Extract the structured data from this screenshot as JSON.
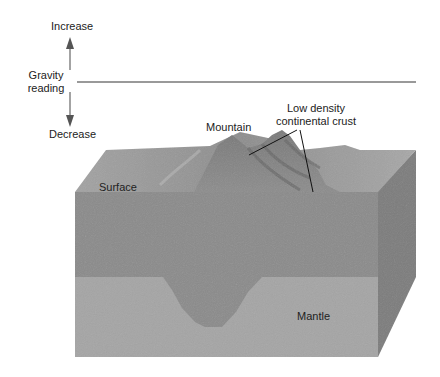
{
  "gravity_axis": {
    "increase_label": "Increase",
    "reading_label_line1": "Gravity",
    "reading_label_line2": "reading",
    "decrease_label": "Decrease"
  },
  "labels": {
    "mountain": "Mountain",
    "crust_line1": "Low density",
    "crust_line2": "continental crust",
    "surface": "Surface",
    "mantle": "Mantle"
  },
  "colors": {
    "crust_front": "#8c8c8c",
    "mantle_front": "#a6a6a6",
    "side_face": "#7a7a7a",
    "top_surface": "#9a9a9a",
    "mountain_dark": "#6e6e6e",
    "axis": "#666666"
  }
}
